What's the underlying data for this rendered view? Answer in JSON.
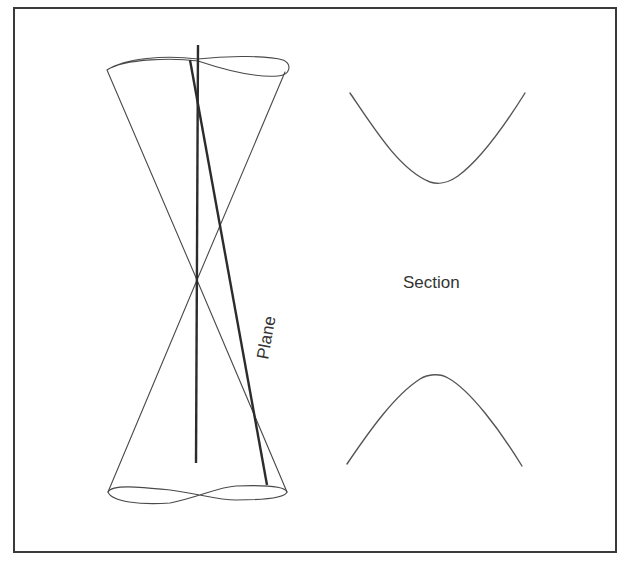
{
  "figure": {
    "type": "conic-section-diagram",
    "labels": {
      "plane": "Plane",
      "section": "Section"
    },
    "colors": {
      "background": "#ffffff",
      "frame": "#3a3a3a",
      "line": "#4a4a4a",
      "axis_and_plane": "#2c2c2c",
      "text": "#333333"
    },
    "elements": [
      {
        "name": "double-cone",
        "description": "Two nappes meeting at a common apex"
      },
      {
        "name": "cone-axis",
        "description": "Vertical axis through the apex"
      },
      {
        "name": "cutting-plane",
        "description": "Steep plane edge cutting both nappes",
        "label": "Plane"
      },
      {
        "name": "hyperbola-upper-branch",
        "description": "Upper branch of section, opening upward"
      },
      {
        "name": "hyperbola-lower-branch",
        "description": "Lower branch of section, opening downward"
      }
    ],
    "section_label": "Section"
  }
}
